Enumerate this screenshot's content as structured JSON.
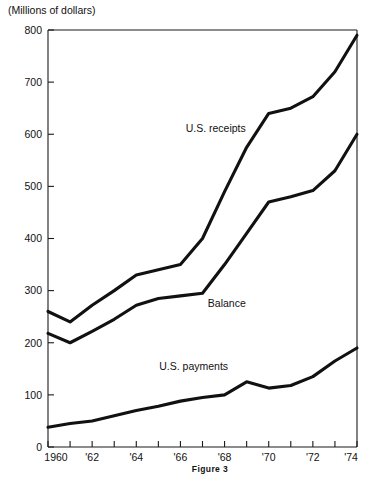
{
  "figure": {
    "caption": "Figure 3",
    "y_axis_title": "(Millions of dollars)"
  },
  "chart_data": {
    "type": "line",
    "title": "",
    "subtitle": "",
    "xlabel": "",
    "ylabel": "(Millions of dollars)",
    "xlim": [
      1960,
      1974
    ],
    "ylim": [
      0,
      800
    ],
    "grid": false,
    "legend_position": "inline-annotations",
    "y_ticks": [
      0,
      100,
      200,
      300,
      400,
      500,
      600,
      700,
      800
    ],
    "y_tick_labels": [
      "0",
      "100",
      "200",
      "300",
      "400",
      "500",
      "600",
      "700",
      "800"
    ],
    "x_ticks": [
      1960,
      1961,
      1962,
      1963,
      1964,
      1965,
      1966,
      1967,
      1968,
      1969,
      1970,
      1971,
      1972,
      1973,
      1974
    ],
    "x_tick_labels": [
      "1960",
      "",
      "'62",
      "",
      "'64",
      "",
      "'66",
      "",
      "'68",
      "",
      "'70",
      "",
      "'72",
      "",
      "'74"
    ],
    "x": [
      1960,
      1961,
      1962,
      1963,
      1964,
      1965,
      1966,
      1967,
      1968,
      1969,
      1970,
      1971,
      1972,
      1973,
      1974
    ],
    "series": [
      {
        "name": "U.S. receipts",
        "label": "U.S. receipts",
        "label_x": 1967.6,
        "label_y": 605,
        "values": [
          260,
          240,
          272,
          300,
          330,
          340,
          350,
          400,
          490,
          575,
          640,
          650,
          672,
          720,
          790
        ]
      },
      {
        "name": "Balance",
        "label": "Balance",
        "label_x": 1968.1,
        "label_y": 268,
        "values": [
          218,
          200,
          222,
          245,
          272,
          285,
          290,
          295,
          350,
          410,
          470,
          480,
          492,
          530,
          600
        ]
      },
      {
        "name": "U.S. payments",
        "label": "U.S. payments",
        "label_x": 1966.6,
        "label_y": 148,
        "values": [
          38,
          45,
          50,
          60,
          70,
          78,
          88,
          95,
          100,
          125,
          113,
          118,
          135,
          165,
          190
        ]
      }
    ]
  }
}
